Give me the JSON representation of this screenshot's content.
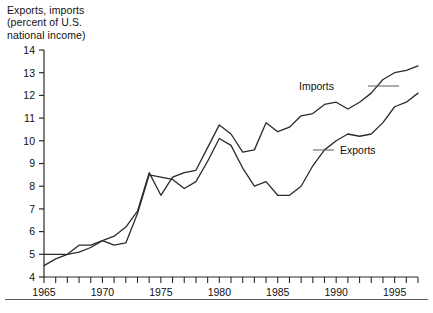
{
  "figure": {
    "axis_title_lines": [
      "Exports, imports",
      "(percent of U.S.",
      "national income)"
    ],
    "axis_title_text": "Exports, imports\n(percent of U.S.\nnational income)"
  },
  "chart_data": {
    "type": "line",
    "title": "Exports, imports (percent of U.S. national income)",
    "xlabel": "",
    "ylabel": "Exports, imports (percent of U.S. national income)",
    "xlim": [
      1965,
      1997
    ],
    "ylim": [
      4,
      14
    ],
    "yticks": [
      4,
      5,
      6,
      7,
      8,
      9,
      10,
      11,
      12,
      13,
      14
    ],
    "ytick_labels": [
      "4",
      "5",
      "6",
      "7",
      "8",
      "9",
      "10",
      "11",
      "12",
      "13",
      "14"
    ],
    "xticks": [
      1965,
      1966,
      1967,
      1968,
      1969,
      1970,
      1971,
      1972,
      1973,
      1974,
      1975,
      1976,
      1977,
      1978,
      1979,
      1980,
      1981,
      1982,
      1983,
      1984,
      1985,
      1986,
      1987,
      1988,
      1989,
      1990,
      1991,
      1992,
      1993,
      1994,
      1995,
      1996,
      1997
    ],
    "xtick_labels_major": [
      "1965",
      "1970",
      "1975",
      "1980",
      "1985",
      "1990",
      "1995"
    ],
    "xticks_major": [
      1965,
      1970,
      1975,
      1980,
      1985,
      1990,
      1995
    ],
    "grid": false,
    "legend_position": "inline-annotations",
    "line_color": "#2b2b2b",
    "x": [
      1965,
      1966,
      1967,
      1968,
      1969,
      1970,
      1971,
      1972,
      1973,
      1974,
      1975,
      1976,
      1977,
      1978,
      1979,
      1980,
      1981,
      1982,
      1983,
      1984,
      1985,
      1986,
      1987,
      1988,
      1989,
      1990,
      1991,
      1992,
      1993,
      1994,
      1995,
      1996,
      1997
    ],
    "series": [
      {
        "name": "Exports",
        "label": "Exports",
        "values": [
          5.0,
          5.0,
          5.0,
          5.1,
          5.3,
          5.6,
          5.4,
          5.5,
          6.8,
          8.5,
          8.4,
          8.3,
          7.9,
          8.2,
          9.1,
          10.1,
          9.8,
          8.8,
          8.0,
          8.2,
          7.6,
          7.6,
          8.0,
          8.9,
          9.6,
          10.0,
          10.3,
          10.2,
          10.3,
          10.8,
          11.5,
          11.7,
          12.1
        ]
      },
      {
        "name": "Imports",
        "label": "Imports",
        "values": [
          4.5,
          4.8,
          5.0,
          5.4,
          5.4,
          5.6,
          5.8,
          6.2,
          6.9,
          8.6,
          7.6,
          8.4,
          8.6,
          8.7,
          9.7,
          10.7,
          10.3,
          9.5,
          9.6,
          10.8,
          10.4,
          10.6,
          11.1,
          11.2,
          11.6,
          11.7,
          11.4,
          11.7,
          12.1,
          12.7,
          13.0,
          13.1,
          13.3
        ]
      }
    ],
    "annotations": [
      {
        "text": "Imports",
        "series": "Imports",
        "anchor_year": 1991
      },
      {
        "text": "Exports",
        "series": "Exports",
        "anchor_year": 1989
      }
    ]
  }
}
